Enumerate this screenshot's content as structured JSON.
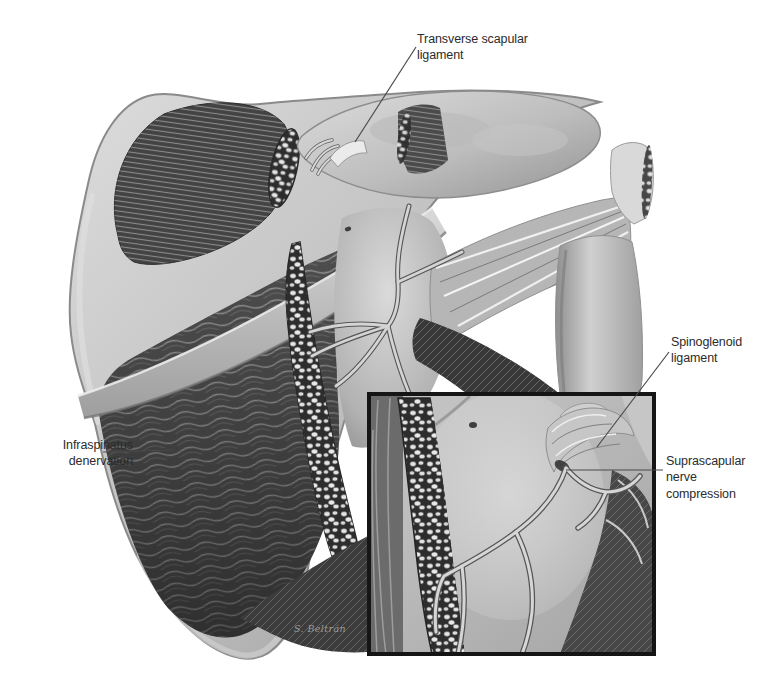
{
  "figure": {
    "kind": "anatomical illustration, posterior shoulder / scapula, grayscale",
    "labels": {
      "transverse_scapular_ligament": "Transverse scapular ligament",
      "spinoglenoid_ligament": "Spinoglenoid ligament",
      "suprascapular_nerve_compression": "Suprascapular nerve compression",
      "infraspinatus_denervation": "Infraspinatus denervation"
    },
    "signature": "S. Beltrán",
    "colors": {
      "background": "#ffffff",
      "bone_light": "#d8d8d8",
      "bone_shadow": "#8f8f8f",
      "muscle_dark": "#3c3c3c",
      "muscle_mid": "#6e6e6e",
      "fat_pebble": "#e4e4e4",
      "nerve": "#d6d6d6",
      "label_text": "#2b2b2b",
      "leader_line": "#4a4a4a",
      "inset_border": "#151515"
    }
  }
}
